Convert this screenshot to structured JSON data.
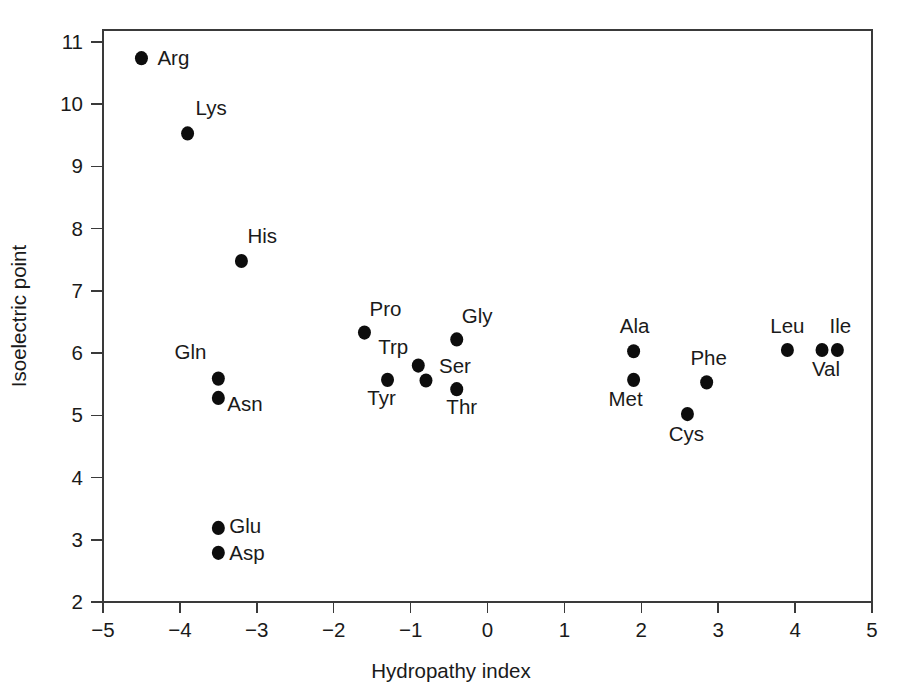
{
  "chart_data": {
    "type": "scatter",
    "title": "",
    "xlabel": "Hydropathy index",
    "ylabel": "Isoelectric point",
    "xlim": [
      -5,
      5
    ],
    "ylim": [
      2,
      11
    ],
    "xticks": [
      -5,
      -4,
      -3,
      -2,
      -1,
      0,
      1,
      2,
      3,
      4,
      5
    ],
    "xtick_labels": [
      "−5",
      "−4",
      "−3",
      "−2",
      "−1",
      "0",
      "1",
      "2",
      "3",
      "4",
      "5"
    ],
    "yticks": [
      2,
      3,
      4,
      5,
      6,
      7,
      8,
      9,
      10,
      11
    ],
    "ytick_labels": [
      "2",
      "3",
      "4",
      "5",
      "6",
      "7",
      "8",
      "9",
      "10",
      "11"
    ],
    "grid": false,
    "legend": "none",
    "marker": "filled-circle",
    "marker_color": "#0d0d0d",
    "marker_size_px": 13,
    "frame_color": "#3a3a3a",
    "background": "#ffffff",
    "points": [
      {
        "label": "Arg",
        "x": -4.5,
        "y": 10.74,
        "lx": 16,
        "ly": 7,
        "anchor": "start"
      },
      {
        "label": "Lys",
        "x": -3.9,
        "y": 9.53,
        "lx": 8,
        "ly": -18,
        "anchor": "start"
      },
      {
        "label": "His",
        "x": -3.2,
        "y": 7.48,
        "lx": 6,
        "ly": -18,
        "anchor": "start"
      },
      {
        "label": "Gln",
        "x": -3.5,
        "y": 5.59,
        "lx": -12,
        "ly": -20,
        "anchor": "end"
      },
      {
        "label": "Asn",
        "x": -3.5,
        "y": 5.28,
        "lx": 9,
        "ly": 13,
        "anchor": "start"
      },
      {
        "label": "Glu",
        "x": -3.5,
        "y": 3.19,
        "lx": 11,
        "ly": 5,
        "anchor": "start"
      },
      {
        "label": "Asp",
        "x": -3.5,
        "y": 2.79,
        "lx": 11,
        "ly": 7,
        "anchor": "start"
      },
      {
        "label": "Pro",
        "x": -1.6,
        "y": 6.33,
        "lx": 5,
        "ly": -17,
        "anchor": "start"
      },
      {
        "label": "Tyr",
        "x": -1.3,
        "y": 5.57,
        "lx": -6,
        "ly": 25,
        "anchor": "middle"
      },
      {
        "label": "Trp",
        "x": -0.9,
        "y": 5.8,
        "lx": -10,
        "ly": -12,
        "anchor": "end"
      },
      {
        "label": "Ser",
        "x": -0.8,
        "y": 5.56,
        "lx": 13,
        "ly": -7,
        "anchor": "start"
      },
      {
        "label": "Thr",
        "x": -0.4,
        "y": 5.42,
        "lx": 5,
        "ly": 25,
        "anchor": "middle"
      },
      {
        "label": "Gly",
        "x": -0.4,
        "y": 6.22,
        "lx": 5,
        "ly": -16,
        "anchor": "start"
      },
      {
        "label": "Ala",
        "x": 1.9,
        "y": 6.03,
        "lx": 1,
        "ly": -18,
        "anchor": "middle"
      },
      {
        "label": "Met",
        "x": 1.9,
        "y": 5.57,
        "lx": -8,
        "ly": 26,
        "anchor": "middle"
      },
      {
        "label": "Cys",
        "x": 2.6,
        "y": 5.02,
        "lx": -1,
        "ly": 27,
        "anchor": "middle"
      },
      {
        "label": "Phe",
        "x": 2.85,
        "y": 5.53,
        "lx": 2,
        "ly": -17,
        "anchor": "middle"
      },
      {
        "label": "Leu",
        "x": 3.9,
        "y": 6.05,
        "lx": 0,
        "ly": -17,
        "anchor": "middle"
      },
      {
        "label": "Val",
        "x": 4.35,
        "y": 6.05,
        "lx": 4,
        "ly": 26,
        "anchor": "middle"
      },
      {
        "label": "Ile",
        "x": 4.55,
        "y": 6.05,
        "lx": 3,
        "ly": -17,
        "anchor": "middle"
      }
    ]
  }
}
